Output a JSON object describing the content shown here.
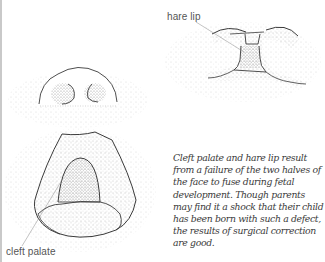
{
  "labels": {
    "hare_lip": "hare lip",
    "cleft_palate": "cleft palate"
  },
  "caption": "Cleft palate and hare lip result from a failure of the two halves of the face to fuse during fetal development. Though parents may find it a shock that their child has been born with such a defect, the results of surgical correction are good.",
  "illustrations": [
    {
      "name": "hare-lip-illustration",
      "depicts": "mouth with hare lip"
    },
    {
      "name": "nose-illustration",
      "depicts": "nose and nostrils viewed from below"
    },
    {
      "name": "cleft-palate-illustration",
      "depicts": "open mouth showing cleft palate"
    }
  ],
  "colors": {
    "ink": "#3a3a3a",
    "stipple": "#9a9a9a",
    "page_edge": "#c9c9c9"
  }
}
